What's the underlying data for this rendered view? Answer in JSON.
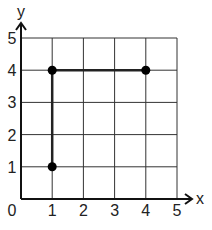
{
  "chart_data": {
    "type": "scatter",
    "title": "",
    "xlabel": "x",
    "ylabel": "y",
    "xlim": [
      0,
      5
    ],
    "ylim": [
      0,
      5
    ],
    "grid": true,
    "x_ticks": [
      "1",
      "2",
      "3",
      "4",
      "5"
    ],
    "y_ticks": [
      "1",
      "2",
      "3",
      "4",
      "5"
    ],
    "origin_label": "0",
    "points": [
      {
        "x": 1,
        "y": 1
      },
      {
        "x": 1,
        "y": 4
      },
      {
        "x": 4,
        "y": 4
      }
    ],
    "segments": [
      {
        "from": [
          1,
          1
        ],
        "to": [
          1,
          4
        ]
      },
      {
        "from": [
          1,
          4
        ],
        "to": [
          4,
          4
        ]
      }
    ]
  },
  "colors": {
    "grid": "#333333",
    "axis": "#111111",
    "point": "#000000",
    "segment": "#222222"
  }
}
